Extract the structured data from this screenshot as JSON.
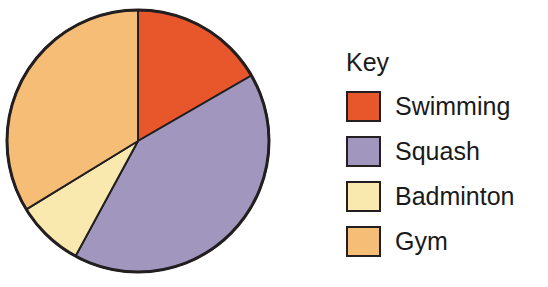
{
  "chart_data": {
    "type": "pie",
    "title": "",
    "legend_title": "Key",
    "legend_position": "right",
    "grid": false,
    "categories": [
      "Swimming",
      "Squash",
      "Badminton",
      "Gym"
    ],
    "values": [
      16.7,
      41.3,
      8.3,
      33.7
    ],
    "unit": "percent",
    "angles_deg": [
      60,
      148.5,
      30,
      121.5
    ],
    "start_angle_deg": 0,
    "direction": "clockwise",
    "colors": [
      "#E8572C",
      "#A096BE",
      "#FAE9AE",
      "#F6BD77"
    ],
    "outline_color": "#231f20",
    "slices": [
      {
        "label": "Swimming",
        "value": 16.7,
        "angle_deg": 60,
        "color": "#E8572C"
      },
      {
        "label": "Squash",
        "value": 41.3,
        "angle_deg": 148.5,
        "color": "#A096BE"
      },
      {
        "label": "Badminton",
        "value": 8.3,
        "angle_deg": 30,
        "color": "#FAE9AE"
      },
      {
        "label": "Gym",
        "value": 33.7,
        "angle_deg": 121.5,
        "color": "#F6BD77"
      }
    ]
  },
  "legend": {
    "title": "Key",
    "items": [
      {
        "label": "Swimming",
        "color": "#E8572C"
      },
      {
        "label": "Squash",
        "color": "#A096BE"
      },
      {
        "label": "Badminton",
        "color": "#FAE9AE"
      },
      {
        "label": "Gym",
        "color": "#F6BD77"
      }
    ]
  },
  "pie": {
    "center_x": 138,
    "center_y": 141,
    "radius": 131
  }
}
